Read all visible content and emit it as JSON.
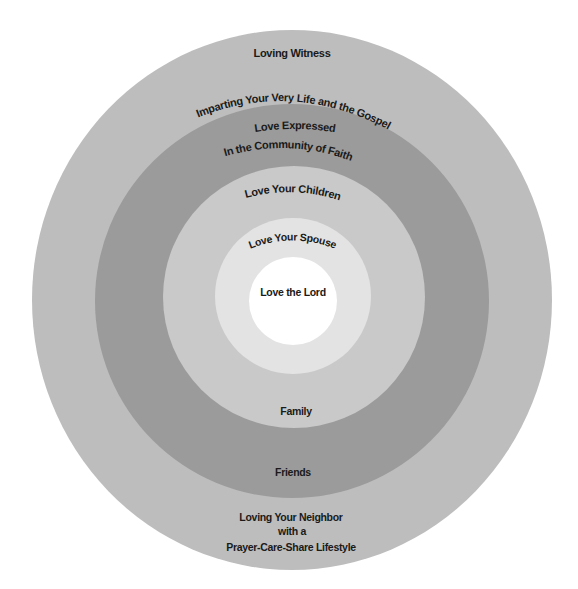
{
  "diagram": {
    "type": "concentric-circles",
    "colors": {
      "outer": "#bdbdbd",
      "community": "#9b9b9b",
      "children": "#c9c9c9",
      "spouse": "#e3e3e3",
      "center": "#ffffff",
      "text": "#1a1a1a"
    },
    "rings": [
      {
        "id": "outer",
        "top_labels": [
          "Loving Witness",
          "Imparting Your Very Life and the Gospel"
        ],
        "bottom_labels": [
          "Loving Your Neighbor",
          "with a",
          "Prayer-Care-Share Lifestyle"
        ]
      },
      {
        "id": "community",
        "top_labels": [
          "Love Expressed",
          "In the Community of Faith"
        ],
        "bottom_label": "Friends"
      },
      {
        "id": "children",
        "top_label": "Love Your Children",
        "bottom_label": "Family"
      },
      {
        "id": "spouse",
        "top_label": "Love Your Spouse"
      },
      {
        "id": "center",
        "label": "Love the Lord"
      }
    ]
  }
}
